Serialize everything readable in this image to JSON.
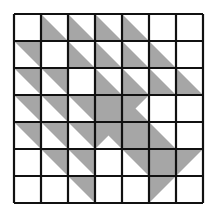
{
  "diagram": {
    "type": "triangle-tile-grid",
    "rows": 7,
    "cols": 7,
    "fill_color": "#a6a6a6",
    "line_color": "#111111",
    "background_color": "#ffffff",
    "legend": {
      "E": "empty",
      "LL": "lower-left half filled (diagonal top-left to bottom-right)",
      "UR": "upper-right half filled (diagonal top-left to bottom-right)",
      "TL": "upper-left half filled (diagonal top-right to bottom-left)",
      "F": "fully filled",
      "WR": "filled with white triangle notch on right side",
      "WB": "filled with white triangle notch on bottom side"
    },
    "cells": [
      [
        "E",
        "LL",
        "LL",
        "LL",
        "LL",
        "E",
        "E"
      ],
      [
        "UR",
        "E",
        "LL",
        "LL",
        "LL",
        "LL",
        "E"
      ],
      [
        "UR",
        "UR",
        "E",
        "LL",
        "LL",
        "LL",
        "LL"
      ],
      [
        "UR",
        "UR",
        "UR",
        "F",
        "WR",
        "E",
        "E"
      ],
      [
        "UR",
        "UR",
        "UR",
        "WB",
        "F",
        "LL",
        "E"
      ],
      [
        "E",
        "UR",
        "UR",
        "E",
        "UR",
        "F",
        "TL"
      ],
      [
        "E",
        "E",
        "UR",
        "E",
        "E",
        "TL",
        "E"
      ]
    ]
  }
}
